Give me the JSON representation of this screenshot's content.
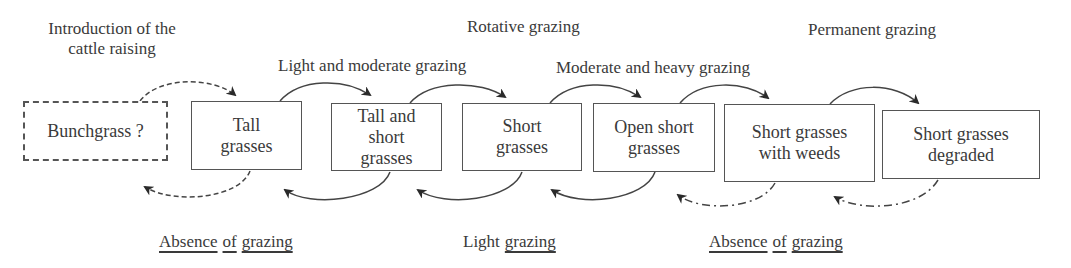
{
  "top_labels": {
    "introduction_line1": "Introduction of the",
    "introduction_line2": "cattle raising",
    "light_moderate": "Light and moderate grazing",
    "rotative": "Rotative grazing",
    "moderate_heavy": "Moderate and heavy grazing",
    "permanent": "Permanent grazing"
  },
  "boxes": [
    {
      "label": "Bunchgrass ?",
      "style": "dashed"
    },
    {
      "label": "Tall\ngrasses",
      "style": "solid"
    },
    {
      "label": "Tall and\nshort\ngrasses",
      "style": "solid"
    },
    {
      "label": "Short\ngrasses",
      "style": "solid"
    },
    {
      "label": "Open short\ngrasses",
      "style": "solid"
    },
    {
      "label": "Short grasses\nwith weeds",
      "style": "solid"
    },
    {
      "label": "Short grasses\ndegraded",
      "style": "solid"
    }
  ],
  "bottom_labels": {
    "absence_left": {
      "w1": "Absence",
      "w2": "of",
      "w3": "grazing"
    },
    "light": {
      "w1": "Light",
      "w2": "grazing"
    },
    "absence_right": {
      "w1": "Absence",
      "w2": "of",
      "w3": "grazing"
    }
  },
  "colors": {
    "stroke": "#444444",
    "text": "#3a3a3a"
  }
}
